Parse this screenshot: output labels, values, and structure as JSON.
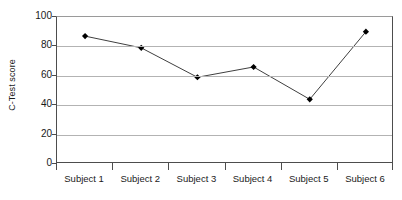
{
  "chart_data": {
    "type": "line",
    "title": "",
    "subtitle": "",
    "xlabel": "",
    "ylabel": "C-Test score",
    "categories": [
      "Subject 1",
      "Subject 2",
      "Subject 3",
      "Subject 4",
      "Subject 5",
      "Subject 6"
    ],
    "values": [
      87,
      79,
      59,
      66,
      44,
      90
    ],
    "series": [
      {
        "name": "C-Test score",
        "values": [
          87,
          79,
          59,
          66,
          44,
          90
        ]
      }
    ],
    "ylim": [
      0,
      100
    ],
    "yticks": [
      0,
      20,
      40,
      60,
      80,
      100
    ],
    "ytick_labels": [
      "0",
      "20",
      "40",
      "60",
      "80",
      "100"
    ],
    "grid": "horizontal",
    "legend": "none",
    "marker": "diamond",
    "marker_color": "#000000",
    "line_color": "#3f3f3f",
    "gridline_color": "#b3b3b3",
    "axis_color": "#4d4d4d",
    "background_color": "#ffffff",
    "text_color": "#1a1a1a"
  }
}
